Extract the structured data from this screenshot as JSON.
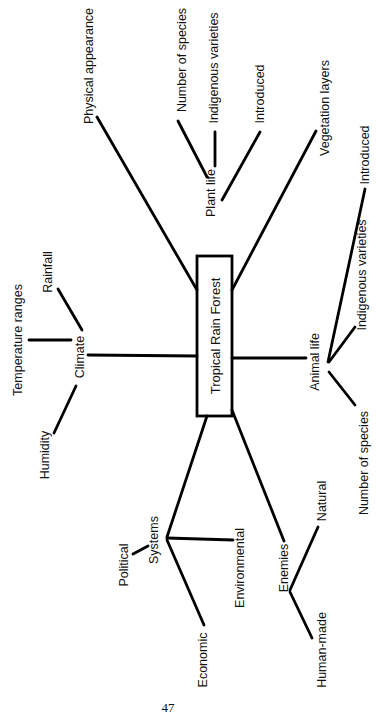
{
  "diagram": {
    "type": "concept map",
    "orientation": "rotated 90 degrees counter-clockwise",
    "center": "Tropical Rain Forest",
    "nodes": {
      "climate": "Climate",
      "temperature_ranges": "Temperature ranges",
      "rainfall": "Rainfall",
      "humidity": "Humidity",
      "physical_appearance": "Physical appearance",
      "plant_life": "Plant life",
      "plant_number_of_species": "Number of species",
      "plant_indigenous_varieties": "Indigenous varieties",
      "plant_introduced": "Introduced",
      "vegetation_layers": "Vegetation layers",
      "animal_life": "Animal life",
      "animal_introduced": "Introduced",
      "animal_indigenous_varieties": "Indigenous varieties",
      "animal_number_of_species": "Number of species",
      "systems": "Systems",
      "political": "Political",
      "environmental": "Environmental",
      "economic": "Economic",
      "enemies": "Enemies",
      "natural": "Natural",
      "human_made": "Human-made"
    },
    "hierarchy": [
      {
        "node": "Climate",
        "children": [
          "Temperature ranges",
          "Rainfall",
          "Humidity"
        ]
      },
      {
        "node": "Physical appearance",
        "children": []
      },
      {
        "node": "Plant life",
        "children": [
          "Number of species",
          "Indigenous varieties",
          "Introduced"
        ]
      },
      {
        "node": "Vegetation layers",
        "children": []
      },
      {
        "node": "Animal life",
        "children": [
          "Introduced",
          "Indigenous varieties",
          "Number of species"
        ]
      },
      {
        "node": "Systems",
        "children": [
          "Political",
          "Environmental",
          "Economic"
        ]
      },
      {
        "node": "Enemies",
        "children": [
          "Natural",
          "Human-made"
        ]
      }
    ]
  },
  "page": {
    "number": "47"
  }
}
